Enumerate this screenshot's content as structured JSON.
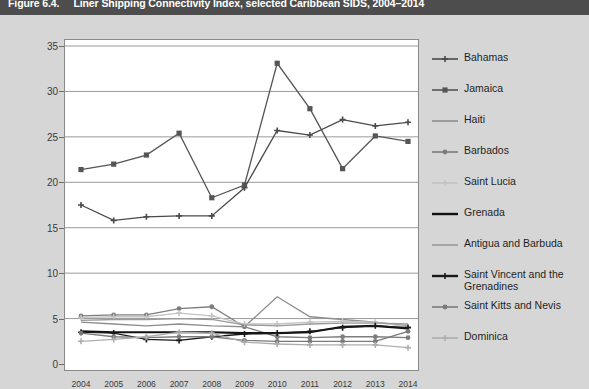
{
  "figure": {
    "number": "Figure 6.4.",
    "title": "Liner Shipping Connectivity Index, selected Caribbean SIDS, 2004–2014"
  },
  "axis_note": "LSCI",
  "legend": {
    "items": [
      {
        "label": "Bahamas",
        "color": "#4a4a4a",
        "marker": "plus"
      },
      {
        "label": "Jamaica",
        "color": "#555555",
        "marker": "square"
      },
      {
        "label": "Haiti",
        "color": "#8e8e8e",
        "marker": "line"
      },
      {
        "label": "Barbados",
        "color": "#7d7d7d",
        "marker": "circle"
      },
      {
        "label": "Saint Lucia",
        "color": "#c4c4c4",
        "marker": "plus"
      },
      {
        "label": "Grenada",
        "color": "#111111",
        "marker": "thickline"
      },
      {
        "label": "Antigua and Barbuda",
        "color": "#9a9a9a",
        "marker": "line"
      },
      {
        "label": "Saint Vincent and the Grenadines",
        "color": "#1a1a1a",
        "marker": "plus"
      },
      {
        "label": "Saint Kitts and Nevis",
        "color": "#7a7a7a",
        "marker": "circle"
      },
      {
        "label": "Dominica",
        "color": "#aeaeae",
        "marker": "plus"
      }
    ]
  },
  "chart_data": {
    "type": "line",
    "title": "Liner Shipping Connectivity Index, selected Caribbean SIDS, 2004–2014",
    "xlabel": "",
    "ylabel": "LSCI",
    "ylim": [
      0,
      35
    ],
    "ytick_values": [
      0,
      5,
      10,
      15,
      20,
      25,
      30,
      35
    ],
    "grid": true,
    "legend_position": "right",
    "categories": [
      "2004",
      "2005",
      "2006",
      "2007",
      "2008",
      "2009",
      "2010",
      "2011",
      "2012",
      "2013",
      "2014"
    ],
    "series": [
      {
        "name": "Bahamas",
        "color": "#4a4a4a",
        "values": [
          17.5,
          15.8,
          16.2,
          16.3,
          16.3,
          19.4,
          25.7,
          25.2,
          26.9,
          26.2,
          26.6
        ]
      },
      {
        "name": "Jamaica",
        "color": "#555555",
        "values": [
          21.4,
          22.0,
          23.0,
          25.4,
          18.3,
          19.7,
          33.1,
          28.1,
          21.5,
          25.1,
          24.5
        ]
      },
      {
        "name": "Haiti",
        "color": "#8e8e8e",
        "values": [
          4.6,
          4.4,
          4.2,
          4.4,
          4.2,
          4.1,
          7.4,
          5.2,
          4.9,
          4.6,
          4.2
        ]
      },
      {
        "name": "Barbados",
        "color": "#7d7d7d",
        "values": [
          5.3,
          5.4,
          5.4,
          6.1,
          6.3,
          4.1,
          3.0,
          2.9,
          3.0,
          3.0,
          2.9
        ]
      },
      {
        "name": "Saint Lucia",
        "color": "#c4c4c4",
        "values": [
          5.1,
          5.2,
          5.2,
          5.6,
          5.3,
          4.4,
          4.4,
          4.6,
          4.7,
          4.6,
          4.1
        ]
      },
      {
        "name": "Grenada",
        "color": "#111111",
        "values": [
          3.6,
          3.5,
          3.5,
          3.5,
          3.5,
          3.4,
          3.4,
          3.5,
          4.1,
          4.2,
          3.9
        ]
      },
      {
        "name": "Antigua and Barbuda",
        "color": "#9a9a9a",
        "values": [
          4.8,
          4.9,
          4.9,
          5.0,
          4.9,
          4.3,
          4.2,
          4.4,
          4.5,
          4.5,
          4.4
        ]
      },
      {
        "name": "Saint Vincent and the Grenadines",
        "color": "#1a1a1a",
        "values": [
          3.5,
          3.4,
          2.7,
          2.6,
          3.0,
          3.3,
          3.4,
          3.6,
          4.0,
          4.2,
          4.0
        ]
      },
      {
        "name": "Saint Kitts and Nevis",
        "color": "#7a7a7a",
        "values": [
          3.4,
          3.0,
          2.9,
          3.0,
          3.0,
          2.6,
          2.5,
          2.5,
          2.5,
          2.5,
          3.6
        ]
      },
      {
        "name": "Dominica",
        "color": "#aeaeae",
        "values": [
          2.5,
          2.7,
          3.0,
          3.5,
          3.4,
          2.4,
          2.2,
          2.1,
          2.1,
          2.1,
          1.8
        ]
      }
    ]
  }
}
